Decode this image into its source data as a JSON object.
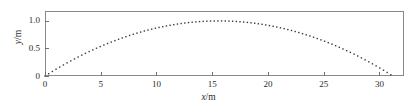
{
  "chart_data": {
    "type": "scatter",
    "title": "",
    "subtitle": "",
    "xlabel_var": "x",
    "xlabel_unit": "/m",
    "xlabel": "x/m",
    "ylabel_var": "y",
    "ylabel_unit": "/m",
    "ylabel": "y/m",
    "xlim": [
      0,
      32.2
    ],
    "ylim": [
      0,
      1.18
    ],
    "xticks": [
      0,
      5,
      10,
      15,
      20,
      25,
      30
    ],
    "xtick_labels": [
      "0",
      "5",
      "10",
      "15",
      "20",
      "25",
      "30"
    ],
    "yticks": [
      0,
      0.5,
      1.0
    ],
    "ytick_labels": [
      "0",
      "0.5",
      "1.0"
    ],
    "grid": false,
    "legend": false,
    "legend_position": "none",
    "marker": "dotted-square",
    "marker_color": "#3a3a3a",
    "frame_color": "#8a8a8a",
    "background": "#ffffff",
    "series": [
      {
        "name": "trajectory",
        "description": "parabolic projectile trajectory",
        "peak_x": 15.6,
        "peak_y": 1.0,
        "x_start": 0.0,
        "x_end": 31.2,
        "x": [
          0.0,
          0.6,
          1.2,
          1.8,
          2.4,
          3.0,
          3.6,
          4.2,
          4.8,
          5.4,
          6.0,
          6.6,
          7.2,
          7.8,
          8.4,
          9.0,
          9.6,
          10.2,
          10.8,
          11.4,
          12.0,
          12.6,
          13.2,
          13.8,
          14.4,
          15.0,
          15.6,
          16.2,
          16.8,
          17.4,
          18.0,
          18.6,
          19.2,
          19.8,
          20.4,
          21.0,
          21.6,
          22.2,
          22.8,
          23.4,
          24.0,
          24.6,
          25.2,
          25.8,
          26.4,
          27.0,
          27.6,
          28.2,
          28.8,
          29.4,
          30.0,
          30.6,
          31.2
        ],
        "y": [
          0.0,
          0.076,
          0.148,
          0.216,
          0.28,
          0.341,
          0.398,
          0.451,
          0.5,
          0.546,
          0.588,
          0.626,
          0.661,
          0.692,
          0.719,
          0.743,
          0.763,
          0.78,
          0.793,
          0.802,
          0.808,
          0.81,
          0.808,
          0.803,
          0.794,
          0.782,
          0.766,
          0.746,
          0.723,
          0.696,
          0.666,
          0.632,
          0.594,
          0.553,
          0.508,
          0.46,
          0.408,
          0.352,
          0.293,
          0.23,
          0.164,
          0.094,
          0.021,
          0.0,
          0.0,
          0.0,
          0.0,
          0.0,
          0.0,
          0.0,
          0.0,
          0.0,
          0.0
        ]
      }
    ]
  }
}
